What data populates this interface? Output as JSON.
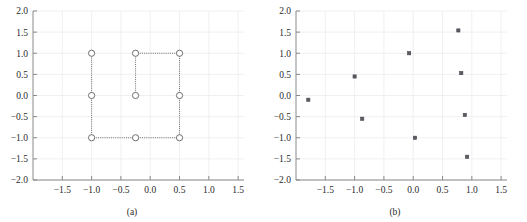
{
  "figure": {
    "panels": [
      {
        "caption": "(a)",
        "xlabel": "",
        "ylabel": "",
        "xticks": [
          "-1.5",
          "-1.0",
          "-0.5",
          "0.0",
          "0.5",
          "1.0",
          "1.5"
        ],
        "yticks": [
          "2.0",
          "1.5",
          "1.0",
          "0.5",
          "0.0",
          "-0.5",
          "-1.0",
          "-1.5",
          "-2.0"
        ]
      },
      {
        "caption": "(b)",
        "xlabel": "",
        "ylabel": "",
        "xticks": [
          "-1.5",
          "-1.0",
          "-0.5",
          "0.0",
          "0.5",
          "1.0",
          "1.5"
        ],
        "yticks": [
          "2.0",
          "1.5",
          "1.0",
          "0.5",
          "0.0",
          "-0.5",
          "-1.0",
          "-1.5",
          "-2.0"
        ]
      }
    ]
  },
  "chart_data": [
    {
      "type": "scatter",
      "title": "",
      "subtitle": "(a)",
      "xlabel": "",
      "ylabel": "",
      "xlim": [
        -2.0,
        1.6
      ],
      "ylim": [
        -2.0,
        2.0
      ],
      "xticks": [
        -1.5,
        -1.0,
        -0.5,
        0.0,
        0.5,
        1.0,
        1.5
      ],
      "yticks": [
        -2.0,
        -1.5,
        -1.0,
        -0.5,
        0.0,
        0.5,
        1.0,
        1.5,
        2.0
      ],
      "grid": true,
      "legend": "none",
      "marker": "open-circle",
      "points": [
        {
          "x": -1.0,
          "y": 1.0
        },
        {
          "x": -1.0,
          "y": 0.0
        },
        {
          "x": -1.0,
          "y": -1.0
        },
        {
          "x": -0.25,
          "y": 1.0
        },
        {
          "x": -0.25,
          "y": 0.0
        },
        {
          "x": -0.25,
          "y": -1.0
        },
        {
          "x": 0.5,
          "y": 1.0
        },
        {
          "x": 0.5,
          "y": 0.0
        },
        {
          "x": 0.5,
          "y": -1.0
        }
      ],
      "edges": [
        {
          "x1": -1.0,
          "y1": 1.0,
          "x2": -1.0,
          "y2": 0.0
        },
        {
          "x1": -1.0,
          "y1": 0.0,
          "x2": -1.0,
          "y2": -1.0
        },
        {
          "x1": -1.0,
          "y1": -1.0,
          "x2": -0.25,
          "y2": -1.0
        },
        {
          "x1": -0.25,
          "y1": -1.0,
          "x2": 0.5,
          "y2": -1.0
        },
        {
          "x1": 0.5,
          "y1": -1.0,
          "x2": 0.5,
          "y2": 0.0
        },
        {
          "x1": 0.5,
          "y1": 0.0,
          "x2": 0.5,
          "y2": 1.0
        },
        {
          "x1": 0.5,
          "y1": 1.0,
          "x2": -0.25,
          "y2": 1.0
        },
        {
          "x1": -0.25,
          "y1": 1.0,
          "x2": -0.25,
          "y2": 0.0
        }
      ]
    },
    {
      "type": "scatter",
      "title": "",
      "subtitle": "(b)",
      "xlabel": "",
      "ylabel": "",
      "xlim": [
        -2.0,
        1.6
      ],
      "ylim": [
        -2.0,
        2.0
      ],
      "xticks": [
        -1.5,
        -1.0,
        -0.5,
        0.0,
        0.5,
        1.0,
        1.5
      ],
      "yticks": [
        -2.0,
        -1.5,
        -1.0,
        -0.5,
        0.0,
        0.5,
        1.0,
        1.5,
        2.0
      ],
      "grid": true,
      "legend": "none",
      "marker": "filled-square",
      "points": [
        {
          "x": -1.79,
          "y": -0.1
        },
        {
          "x": -1.0,
          "y": 0.45
        },
        {
          "x": -0.87,
          "y": -0.55
        },
        {
          "x": -0.07,
          "y": 1.0
        },
        {
          "x": 0.03,
          "y": -1.0
        },
        {
          "x": 0.77,
          "y": 1.54
        },
        {
          "x": 0.82,
          "y": 0.53
        },
        {
          "x": 0.88,
          "y": -0.46
        },
        {
          "x": 0.92,
          "y": -1.45
        }
      ],
      "edges": []
    }
  ]
}
